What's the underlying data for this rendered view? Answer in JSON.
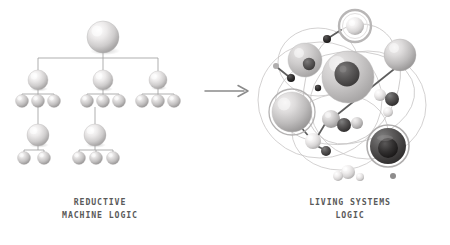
{
  "figure": {
    "background_color": "#ffffff",
    "transition_arrow": {
      "icon": "right-arrow-icon",
      "direction": "right",
      "color": "#8a8a8a",
      "x1": 205,
      "y1": 91,
      "x2": 248,
      "y2": 91
    }
  },
  "left_panel": {
    "caption": "REDUCTIVE\nMACHINE LOGIC",
    "caption_line1": "REDUCTIVE",
    "caption_line2": "MACHINE LOGIC",
    "diagram_type": "hierarchical-tree",
    "line_color": "#9a9a9a",
    "sphere_color_light": "#f2f2f2",
    "sphere_color_mid": "#c9c9c9",
    "sphere_color_dark": "#9b9b9b",
    "levels": 5,
    "node_count": 23,
    "nodes": [
      {
        "id": "root",
        "level": 0,
        "cx": 103,
        "cy": 37,
        "r": 16
      },
      {
        "id": "b1",
        "level": 1,
        "cx": 38,
        "cy": 80,
        "r": 10
      },
      {
        "id": "b2",
        "level": 1,
        "cx": 103,
        "cy": 80,
        "r": 10
      },
      {
        "id": "b3",
        "level": 1,
        "cx": 158,
        "cy": 80,
        "r": 9
      },
      {
        "id": "b1c1",
        "level": 2,
        "cx": 22,
        "cy": 101,
        "r": 6.5
      },
      {
        "id": "b1c2",
        "level": 2,
        "cx": 38,
        "cy": 101,
        "r": 6.5
      },
      {
        "id": "b1c3",
        "level": 2,
        "cx": 54,
        "cy": 101,
        "r": 6.5
      },
      {
        "id": "b2c1",
        "level": 2,
        "cx": 87,
        "cy": 101,
        "r": 6.5
      },
      {
        "id": "b2c2",
        "level": 2,
        "cx": 103,
        "cy": 101,
        "r": 6.5
      },
      {
        "id": "b2c3",
        "level": 2,
        "cx": 119,
        "cy": 101,
        "r": 6.5
      },
      {
        "id": "b3c1",
        "level": 2,
        "cx": 142,
        "cy": 101,
        "r": 6.5
      },
      {
        "id": "b3c2",
        "level": 2,
        "cx": 158,
        "cy": 101,
        "r": 6.5
      },
      {
        "id": "b3c3",
        "level": 2,
        "cx": 174,
        "cy": 101,
        "r": 6.5
      },
      {
        "id": "d1",
        "level": 3,
        "cx": 38,
        "cy": 135,
        "r": 11
      },
      {
        "id": "d2",
        "level": 3,
        "cx": 95,
        "cy": 135,
        "r": 11
      },
      {
        "id": "d1c1",
        "level": 4,
        "cx": 24,
        "cy": 158,
        "r": 6.5
      },
      {
        "id": "d1c2",
        "level": 4,
        "cx": 44,
        "cy": 158,
        "r": 6.5
      },
      {
        "id": "d2c1",
        "level": 4,
        "cx": 79,
        "cy": 158,
        "r": 6.5
      },
      {
        "id": "d2c2",
        "level": 4,
        "cx": 96,
        "cy": 158,
        "r": 6.5
      },
      {
        "id": "d2c3",
        "level": 4,
        "cx": 113,
        "cy": 158,
        "r": 6.5
      }
    ]
  },
  "right_panel": {
    "caption": "LIVING SYSTEMS\nLOGIC",
    "caption_line1": "LIVING SYSTEMS",
    "caption_line2": "LOGIC",
    "diagram_type": "network-cluster",
    "orbit_color": "#c2c2c2",
    "bond_color": "#5e5e5e",
    "thin_link_color": "#b0b0b0",
    "orbits": [
      {
        "id": "orbit-large-left",
        "cx": 320,
        "cy": 100,
        "rx": 62,
        "ry": 58
      },
      {
        "id": "orbit-large-right",
        "cx": 368,
        "cy": 105,
        "rx": 58,
        "ry": 54
      },
      {
        "id": "orbit-upper",
        "cx": 318,
        "cy": 62,
        "rx": 40,
        "ry": 34
      },
      {
        "id": "orbit-lower",
        "cx": 340,
        "cy": 132,
        "rx": 48,
        "ry": 38
      },
      {
        "id": "orbit-wide",
        "cx": 345,
        "cy": 98,
        "rx": 70,
        "ry": 46
      }
    ],
    "spheres": [
      {
        "id": "ring-top",
        "cx": 355,
        "cy": 26,
        "r": 9,
        "tone": "light",
        "ring": true,
        "ring_r": 16,
        "nucleus": false
      },
      {
        "id": "cell-upper-left",
        "cx": 305,
        "cy": 60,
        "r": 17,
        "tone": "light",
        "ring": false,
        "nucleus": true,
        "nucleus_r": 6,
        "nucleus_tone": "dark"
      },
      {
        "id": "cell-center",
        "cx": 348,
        "cy": 77,
        "r": 26,
        "tone": "mid",
        "ring": false,
        "nucleus": true,
        "nucleus_r": 12,
        "nucleus_tone": "dark"
      },
      {
        "id": "cell-upper-right",
        "cx": 400,
        "cy": 55,
        "r": 16,
        "tone": "mid",
        "ring": false,
        "nucleus": false
      },
      {
        "id": "cell-ringed-left",
        "cx": 292,
        "cy": 112,
        "r": 20,
        "tone": "mid",
        "ring": true,
        "ring_r": 23,
        "nucleus": false
      },
      {
        "id": "cell-dark-right",
        "cx": 388,
        "cy": 146,
        "r": 18,
        "tone": "dark",
        "ring": true,
        "ring_r": 21,
        "nucleus": true,
        "nucleus_r": 10,
        "nucleus_tone": "darkest"
      },
      {
        "id": "node-mid-a",
        "cx": 331,
        "cy": 119,
        "r": 9,
        "tone": "mid",
        "ring": false,
        "nucleus": false
      },
      {
        "id": "node-mid-b",
        "cx": 344,
        "cy": 125,
        "r": 7,
        "tone": "dark",
        "ring": false,
        "nucleus": false
      },
      {
        "id": "node-mid-c",
        "cx": 357,
        "cy": 123,
        "r": 6,
        "tone": "mid",
        "ring": false,
        "nucleus": false
      },
      {
        "id": "node-left-low",
        "cx": 313,
        "cy": 141,
        "r": 8,
        "tone": "light",
        "ring": false,
        "nucleus": false
      },
      {
        "id": "node-left-low-b",
        "cx": 326,
        "cy": 151,
        "r": 5,
        "tone": "dark",
        "ring": false,
        "nucleus": false
      },
      {
        "id": "node-right-a",
        "cx": 380,
        "cy": 95,
        "r": 6,
        "tone": "light",
        "ring": false,
        "nucleus": false
      },
      {
        "id": "node-right-b",
        "cx": 392,
        "cy": 99,
        "r": 7,
        "tone": "dark",
        "ring": false,
        "nucleus": false
      },
      {
        "id": "node-right-c",
        "cx": 388,
        "cy": 112,
        "r": 5,
        "tone": "light",
        "ring": false,
        "nucleus": false
      },
      {
        "id": "node-bottom-a",
        "cx": 348,
        "cy": 172,
        "r": 7,
        "tone": "light",
        "ring": false,
        "nucleus": false
      },
      {
        "id": "node-bottom-b",
        "cx": 338,
        "cy": 176,
        "r": 5,
        "tone": "light",
        "ring": false,
        "nucleus": false
      },
      {
        "id": "node-bottom-c",
        "cx": 360,
        "cy": 177,
        "r": 4,
        "tone": "light",
        "ring": false,
        "nucleus": false
      },
      {
        "id": "node-bottom-d",
        "cx": 393,
        "cy": 176,
        "r": 3,
        "tone": "dark",
        "ring": false,
        "nucleus": false
      },
      {
        "id": "node-dark-top",
        "cx": 327,
        "cy": 39,
        "r": 4,
        "tone": "darkest",
        "ring": false,
        "nucleus": false
      },
      {
        "id": "node-dark-left",
        "cx": 291,
        "cy": 78,
        "r": 4,
        "tone": "darkest",
        "ring": false,
        "nucleus": false
      },
      {
        "id": "node-dark-far",
        "cx": 276,
        "cy": 66,
        "r": 3,
        "tone": "mid",
        "ring": false,
        "nucleus": false
      }
    ],
    "bonds": [
      {
        "from": "cell-upper-right",
        "to": "node-mid-a",
        "x1": 398,
        "y1": 66,
        "x2": 333,
        "y2": 118
      },
      {
        "from": "node-mid-a",
        "to": "node-left-low",
        "x1": 325,
        "y1": 124,
        "x2": 316,
        "y2": 139
      },
      {
        "from": "cell-ringed-left",
        "to": "node-left-low",
        "x1": 300,
        "y1": 126,
        "x2": 311,
        "y2": 139
      },
      {
        "from": "node-left-low",
        "to": "node-left-low-b",
        "x1": 317,
        "y1": 146,
        "x2": 325,
        "y2": 150
      },
      {
        "from": "node-right-a",
        "to": "node-right-b",
        "x1": 382,
        "y1": 96,
        "x2": 391,
        "y2": 99
      },
      {
        "from": "node-dark-top",
        "to": "ring-top",
        "x1": 330,
        "y1": 37,
        "x2": 341,
        "y2": 30
      },
      {
        "from": "node-dark-left",
        "to": "node-dark-far",
        "x1": 288,
        "y1": 76,
        "x2": 278,
        "y2": 68
      },
      {
        "from": "node-bottom-a",
        "to": "node-bottom-b",
        "x1": 345,
        "y1": 174,
        "x2": 340,
        "y2": 176
      }
    ]
  }
}
